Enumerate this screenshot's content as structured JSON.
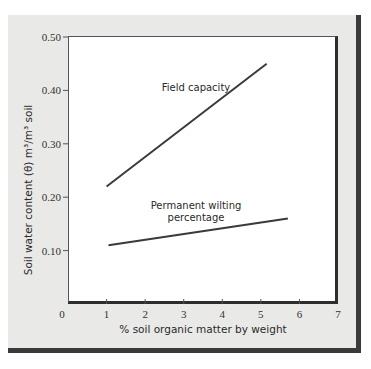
{
  "chart_data": {
    "type": "line",
    "title": "",
    "xlabel": "% soil organic matter by weight",
    "ylabel": "Soil water content (θ) m³/m³ soil",
    "xlim": [
      0,
      7
    ],
    "ylim": [
      0,
      0.5
    ],
    "x_ticks": [
      "0",
      "1",
      "2",
      "3",
      "4",
      "5",
      "6",
      "7"
    ],
    "y_ticks": [
      "0.10",
      "0.20",
      "0.30",
      "0.40",
      "0.50"
    ],
    "grid": false,
    "legend": "none (inline labels)",
    "series": [
      {
        "name": "Field capacity",
        "label_lines": [
          "Field capacity"
        ],
        "color": "#3a3a3a",
        "points": [
          {
            "x": 1.0,
            "y": 0.22
          },
          {
            "x": 5.15,
            "y": 0.45
          }
        ]
      },
      {
        "name": "Permanent wilting percentage",
        "label_lines": [
          "Permanent wilting",
          "percentage"
        ],
        "color": "#3a3a3a",
        "points": [
          {
            "x": 1.05,
            "y": 0.11
          },
          {
            "x": 5.7,
            "y": 0.16
          }
        ]
      }
    ]
  },
  "colors": {
    "panel_bg": "#e9e9e7",
    "plot_bg": "#ffffff",
    "shadow": "#3a3a3a",
    "line": "#3a3a3a"
  }
}
